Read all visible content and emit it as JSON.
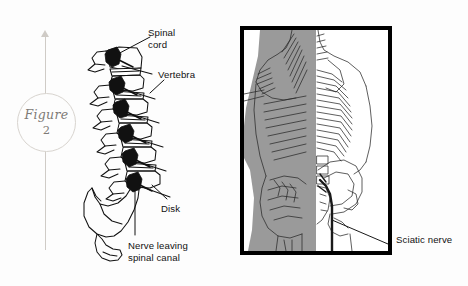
{
  "figure": {
    "word": "Figure",
    "number": "2"
  },
  "spine_diagram": {
    "name": "lateral-spine-illustration",
    "labels": [
      {
        "id": "spinal-cord",
        "text": "Spinal\ncord",
        "x": 148,
        "y": 27
      },
      {
        "id": "vertebra",
        "text": "Vertebra",
        "x": 158,
        "y": 69
      },
      {
        "id": "disk",
        "text": "Disk",
        "x": 161,
        "y": 203
      },
      {
        "id": "nerve-leaving",
        "text": "Nerve leaving\nspinal canal",
        "x": 128,
        "y": 240
      }
    ]
  },
  "torso_panel": {
    "name": "back-anatomy-illustration",
    "labels": [
      {
        "id": "sciatic-nerve",
        "text": "Sciatic nerve",
        "x": 396,
        "y": 239
      }
    ]
  },
  "colors": {
    "ink": "#111111",
    "muscle_gray": "#9a9a9a",
    "frame": "#000000",
    "rule_gray": "#cfcbc6",
    "badge_text": "#7d7a76"
  }
}
